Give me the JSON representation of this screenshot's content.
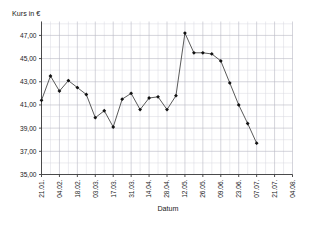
{
  "chart_data": {
    "type": "line",
    "title": "",
    "xlabel": "Datum",
    "ylabel": "Kurs in €",
    "ylim": [
      35.0,
      48.2
    ],
    "yticks": [
      35.0,
      37.0,
      39.0,
      41.0,
      43.0,
      45.0,
      47.0
    ],
    "ytick_labels": [
      "35,00",
      "37,00",
      "39,00",
      "41,00",
      "43,00",
      "45,00",
      "47,00"
    ],
    "xtick_labels": [
      "21.01.",
      "04.02.",
      "18.02.",
      "03.03.",
      "17.03.",
      "31.03.",
      "14.04.",
      "28.04.",
      "12.05.",
      "26.05.",
      "09.06.",
      "23.06.",
      "07.07.",
      "21.07.",
      "04.08."
    ],
    "grid": true,
    "legend": false,
    "marker": "diamond",
    "line_color": "#3c3c3c",
    "marker_color": "#111111",
    "grid_color": "#d8d8e0",
    "x": [
      "21.01.",
      "28.01.",
      "04.02.",
      "11.02.",
      "18.02.",
      "25.02.",
      "03.03.",
      "10.03.",
      "17.03.",
      "24.03.",
      "31.03.",
      "07.04.",
      "14.04.",
      "21.04.",
      "28.04.",
      "05.05.",
      "12.05.",
      "19.05.",
      "26.05.",
      "02.06.",
      "09.06.",
      "16.06.",
      "23.06.",
      "30.06.",
      "07.07."
    ],
    "values": [
      41.4,
      43.5,
      42.2,
      43.1,
      42.5,
      41.9,
      39.9,
      40.5,
      39.1,
      41.5,
      42.0,
      40.6,
      41.6,
      41.7,
      40.6,
      41.8,
      47.2,
      45.5,
      45.5,
      45.4,
      44.8,
      42.9,
      41.0,
      39.4,
      37.7
    ],
    "series": [
      {
        "name": "Kurs",
        "values": [
          41.4,
          43.5,
          42.2,
          43.1,
          42.5,
          41.9,
          39.9,
          40.5,
          39.1,
          41.5,
          42.0,
          40.6,
          41.6,
          41.7,
          40.6,
          41.8,
          47.2,
          45.5,
          45.5,
          45.4,
          44.8,
          42.9,
          41.0,
          39.4,
          37.7
        ]
      }
    ]
  }
}
